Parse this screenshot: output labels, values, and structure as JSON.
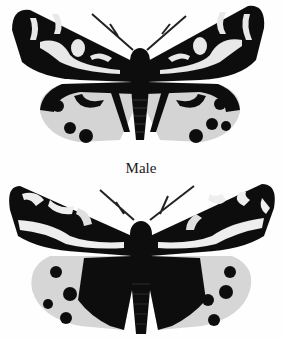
{
  "figure": {
    "moths": [
      {
        "id": "top",
        "description": "Tiger moth, upper specimen"
      },
      {
        "id": "bottom",
        "description": "Tiger moth, lower specimen"
      }
    ],
    "label": "Male"
  },
  "colors": {
    "background": "#fefefe",
    "wing_dark": "#111111",
    "wing_light": "#e8e8e8",
    "hindwing_light": "#d4d4d4"
  }
}
